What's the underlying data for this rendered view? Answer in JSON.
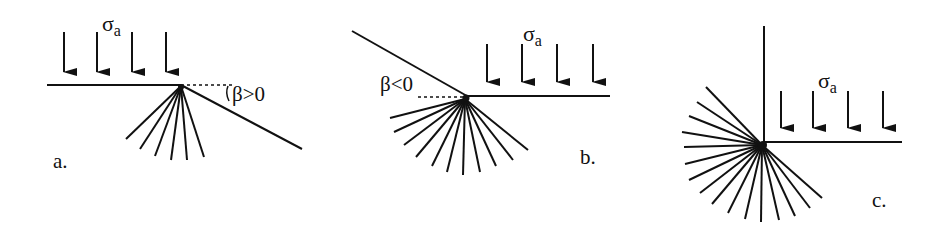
{
  "figure": {
    "panels": [
      {
        "id": "a",
        "label": "a.",
        "load_label": "σ",
        "load_sub": "a",
        "angle_label": "β>0"
      },
      {
        "id": "b",
        "label": "b.",
        "load_label": "σ",
        "load_sub": "a",
        "angle_label": "β<0"
      },
      {
        "id": "c",
        "label": "c.",
        "load_label": "σ",
        "load_sub": "a",
        "angle_label": ""
      }
    ]
  }
}
